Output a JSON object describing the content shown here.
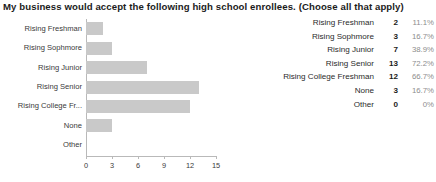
{
  "question": {
    "title": "My business would accept the following high school enrollees. (Choose all that apply)"
  },
  "chart_data": {
    "type": "bar",
    "orientation": "horizontal",
    "title": "My business would accept the following high school enrollees. (Choose all that apply)",
    "xlabel": "",
    "ylabel": "",
    "categories": [
      "Rising Freshman",
      "Rising Sophmore",
      "Rising Junior",
      "Rising Senior",
      "Rising College Fr...",
      "None",
      "Other"
    ],
    "values": [
      2,
      3,
      7,
      13,
      12,
      3,
      0
    ],
    "xlim": [
      0,
      15
    ],
    "xticks": [
      0,
      3,
      6,
      9,
      12,
      15
    ],
    "xtick_labels": [
      "0",
      "3",
      "6",
      "9",
      "12",
      "15"
    ],
    "grid": false,
    "legend": "none",
    "bar_color": "#c9c9c9",
    "axis_color": "#b9b9b9"
  },
  "legend_table": {
    "rows": [
      {
        "label": "Rising Freshman",
        "count": "2",
        "percent": "11.1%"
      },
      {
        "label": "Rising Sophmore",
        "count": "3",
        "percent": "16.7%"
      },
      {
        "label": "Rising Junior",
        "count": "7",
        "percent": "38.9%"
      },
      {
        "label": "Rising Senior",
        "count": "13",
        "percent": "72.2%"
      },
      {
        "label": "Rising College Freshman",
        "count": "12",
        "percent": "66.7%"
      },
      {
        "label": "None",
        "count": "3",
        "percent": "16.7%"
      },
      {
        "label": "Other",
        "count": "0",
        "percent": "0%"
      }
    ]
  }
}
